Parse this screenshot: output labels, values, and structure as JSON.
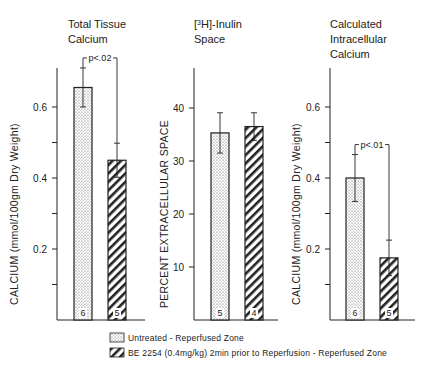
{
  "chart_data": [
    {
      "type": "bar",
      "title": [
        "Total Tissue",
        "Calcium"
      ],
      "ylabel": "CALCIUM (mmol/100gm Dry Weight)",
      "ylim": [
        0,
        0.75
      ],
      "yticks": [
        0.2,
        0.4,
        0.6
      ],
      "minor_ticks": [
        0.1,
        0.3,
        0.5
      ],
      "ytick_labels": [
        "0.2",
        "0.4",
        "0.6"
      ],
      "series": [
        {
          "name": "Untreated - Reperfused Zone",
          "value": 0.655,
          "err": 0.055,
          "n": "6"
        },
        {
          "name": "BE 2254 (0.4mg/kg) 2min prior to Reperfusion - Reperfused Zone",
          "value": 0.45,
          "err": 0.048,
          "n": "5"
        }
      ],
      "annotation": "p<.02"
    },
    {
      "type": "bar",
      "title": [
        "[3H]-Inulin",
        "Space"
      ],
      "ylabel": "PERCENT EXTRACELLULAR SPACE",
      "ylim": [
        0,
        50
      ],
      "yticks": [
        10,
        20,
        30,
        40
      ],
      "minor_ticks": [],
      "ytick_labels": [
        "10",
        "20",
        "30",
        "40"
      ],
      "series": [
        {
          "name": "Untreated - Reperfused Zone",
          "value": 35.3,
          "err": 3.8,
          "n": "5"
        },
        {
          "name": "BE 2254 (0.4mg/kg) 2min prior to Reperfusion - Reperfused Zone",
          "value": 36.5,
          "err": 2.6,
          "n": "4"
        }
      ],
      "annotation": ""
    },
    {
      "type": "bar",
      "title": [
        "Calculated",
        "Intracellular",
        "Calcium"
      ],
      "ylabel": "CALCIUM (mmol/100gm Dry Weight)",
      "ylim": [
        0,
        0.75
      ],
      "yticks": [
        0.2,
        0.4,
        0.6
      ],
      "minor_ticks": [
        0.1,
        0.3,
        0.5
      ],
      "ytick_labels": [
        "0.2",
        "0.4",
        "0.6"
      ],
      "series": [
        {
          "name": "Untreated - Reperfused Zone",
          "value": 0.4,
          "err": 0.066,
          "n": "6"
        },
        {
          "name": "BE 2254 (0.4mg/kg) 2min prior to Reperfusion - Reperfused Zone",
          "value": 0.175,
          "err": 0.05,
          "n": "5"
        }
      ],
      "annotation": "p<.01"
    }
  ],
  "legend": {
    "items": [
      {
        "label": "Untreated - Reperfused Zone",
        "pattern": "dots"
      },
      {
        "label": "BE 2254 (0.4mg/kg) 2min prior to Reperfusion - Reperfused Zone",
        "pattern": "hatch"
      }
    ],
    "placement": "bottom"
  },
  "colors": {
    "ink": "#222222",
    "background": "#ffffff"
  }
}
